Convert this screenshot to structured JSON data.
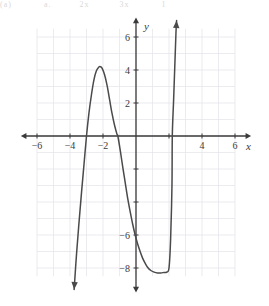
{
  "page": {
    "header_fragments": [
      "(a)",
      "a.",
      "2x",
      "3x",
      "1"
    ]
  },
  "chart_data": {
    "type": "line",
    "title": "",
    "subtitle": "",
    "xlabel": "x",
    "ylabel": "y",
    "xlim": [
      -6.8,
      6.8
    ],
    "ylim": [
      -9.2,
      7.2
    ],
    "grid": true,
    "grid_step": 1,
    "legend": null,
    "axis_arrows": [
      "left",
      "right",
      "up",
      "down"
    ],
    "x_ticks": [
      -6,
      -4,
      -2,
      2,
      4,
      6
    ],
    "x_tick_labels": [
      "−6",
      "−4",
      "−2",
      "",
      "4",
      "6"
    ],
    "x_ticks_shown": [
      -6,
      -4,
      -2,
      4,
      6
    ],
    "y_ticks": [
      -8,
      -6,
      -4,
      -2,
      2,
      4,
      6
    ],
    "y_tick_labels": [
      "−8",
      "−6",
      "",
      "",
      "2",
      "4",
      "6"
    ],
    "y_ticks_shown": [
      -8,
      -6,
      2,
      4,
      6
    ],
    "curve_color": "#4a4a4a",
    "axis_color": "#3a3a3a",
    "grid_color": "#e2e2ea",
    "series": [
      {
        "name": "quartic",
        "x_roots": [
          -3.0,
          -1.1,
          2.2
        ],
        "local_max": {
          "x": -2.15,
          "y": 4.2
        },
        "local_min": {
          "x": 1.85,
          "y": -8.25
        },
        "end_behavior_left": "down",
        "end_behavior_right": "up",
        "points": [
          [
            -3.75,
            -9.3
          ],
          [
            -3.6,
            -7.1
          ],
          [
            -3.45,
            -5.2
          ],
          [
            -3.3,
            -3.4
          ],
          [
            -3.15,
            -1.7
          ],
          [
            -3.0,
            0.0
          ],
          [
            -2.85,
            1.4
          ],
          [
            -2.7,
            2.5
          ],
          [
            -2.55,
            3.4
          ],
          [
            -2.4,
            3.95
          ],
          [
            -2.25,
            4.18
          ],
          [
            -2.15,
            4.2
          ],
          [
            -2.05,
            4.1
          ],
          [
            -1.9,
            3.7
          ],
          [
            -1.75,
            3.05
          ],
          [
            -1.6,
            2.2
          ],
          [
            -1.45,
            1.35
          ],
          [
            -1.3,
            0.65
          ],
          [
            -1.15,
            0.1
          ],
          [
            -1.1,
            0.0
          ],
          [
            -0.95,
            -0.9
          ],
          [
            -0.8,
            -1.9
          ],
          [
            -0.65,
            -2.85
          ],
          [
            -0.5,
            -3.8
          ],
          [
            -0.35,
            -4.6
          ],
          [
            -0.2,
            -5.35
          ],
          [
            -0.05,
            -6.0
          ],
          [
            0.1,
            -6.55
          ],
          [
            0.25,
            -7.0
          ],
          [
            0.4,
            -7.4
          ],
          [
            0.55,
            -7.7
          ],
          [
            0.7,
            -7.95
          ],
          [
            0.9,
            -8.15
          ],
          [
            1.1,
            -8.25
          ],
          [
            1.3,
            -8.3
          ],
          [
            1.5,
            -8.3
          ],
          [
            1.7,
            -8.27
          ],
          [
            1.85,
            -8.25
          ],
          [
            2.0,
            -8.0
          ],
          [
            2.1,
            -6.2
          ],
          [
            2.18,
            -3.0
          ],
          [
            2.2,
            0.0
          ],
          [
            2.28,
            2.2
          ],
          [
            2.35,
            4.2
          ],
          [
            2.42,
            6.2
          ],
          [
            2.46,
            7.0
          ]
        ]
      }
    ]
  }
}
